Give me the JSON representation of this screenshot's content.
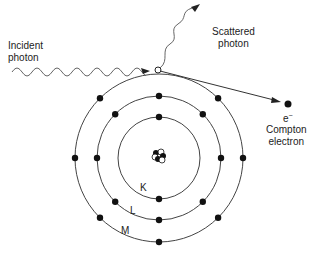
{
  "labels": {
    "incident": [
      "Incident",
      "photon"
    ],
    "scattered": [
      "Scattered",
      "photon"
    ],
    "electron_symbol": "e",
    "electron_charge": "−",
    "compton": [
      "Compton",
      "electron"
    ],
    "shells": [
      "K",
      "L",
      "M"
    ]
  },
  "shells": [
    {
      "name": "K",
      "electrons": 2
    },
    {
      "name": "L",
      "electrons": 8
    },
    {
      "name": "M",
      "electrons": 8
    }
  ],
  "colors": {
    "line": "#444444",
    "dot": "#111111",
    "wave": "#666666"
  }
}
